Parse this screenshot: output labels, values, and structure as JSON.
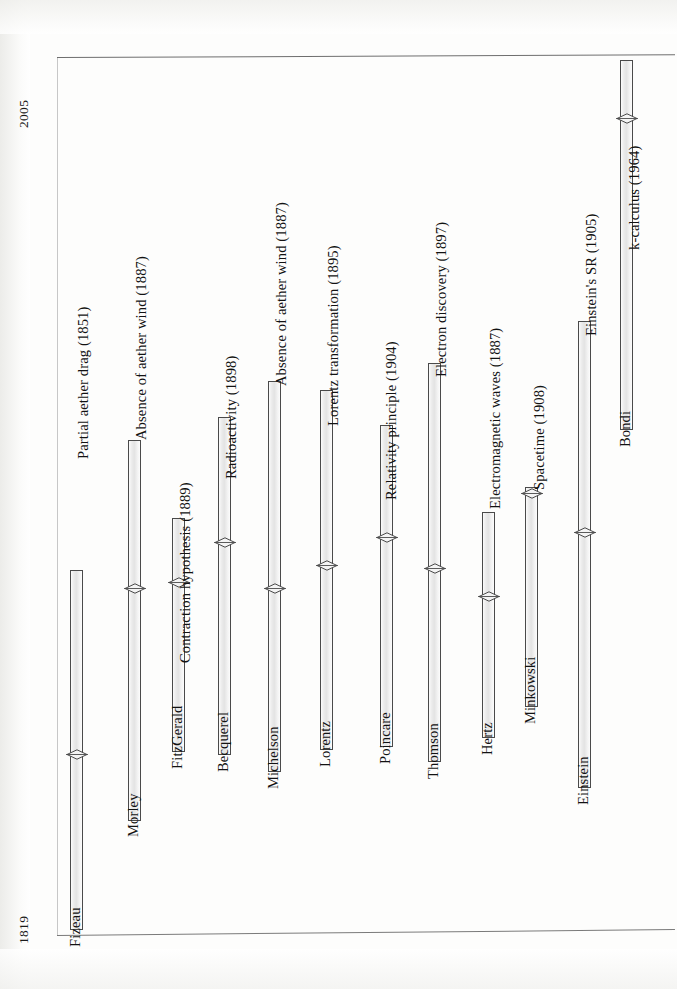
{
  "axis": {
    "top_label": "2005",
    "bottom_label": "1819",
    "year_min": 1819,
    "year_max": 2005
  },
  "chart_data": {
    "type": "bar",
    "title": "",
    "subtitle": "",
    "orientation": "vertical-rotated",
    "xlabel": "",
    "ylabel": "Year",
    "ylim": [
      1819,
      2005
    ],
    "grid": false,
    "legend": "none",
    "categories": [
      "Fizeau",
      "Morley",
      "FitzGerald",
      "Becquerel",
      "Michelson",
      "Lorentz",
      "Poincare",
      "Thomson",
      "Hertz",
      "Minkowski",
      "Einstein",
      "Bondi"
    ],
    "bars": [
      {
        "person": "Fizeau",
        "event": "Partial aether drag (1851)",
        "event_year": 1851,
        "px_left": 70,
        "px_top": 570,
        "px_bottom": 930,
        "marker_px_y": 754
      },
      {
        "person": "Morley",
        "event": "Absence of aether wind (1887)",
        "event_year": 1887,
        "px_left": 128,
        "px_top": 440,
        "px_bottom": 821,
        "marker_px_y": 588
      },
      {
        "person": "FitzGerald",
        "event": "Contraction hypothesis (1889)",
        "event_year": 1889,
        "px_left": 172,
        "px_top": 518,
        "px_bottom": 752,
        "marker_px_y": 582
      },
      {
        "person": "Becquerel",
        "event": "Radioactivity (1898)",
        "event_year": 1898,
        "px_left": 218,
        "px_top": 417,
        "px_bottom": 755,
        "marker_px_y": 542
      },
      {
        "person": "Michelson",
        "event": "Absence of aether wind (1887)",
        "event_year": 1887,
        "px_left": 268,
        "px_top": 381,
        "px_bottom": 772,
        "marker_px_y": 588
      },
      {
        "person": "Lorentz",
        "event": "Lorentz transformation (1895)",
        "event_year": 1895,
        "px_left": 320,
        "px_top": 390,
        "px_bottom": 750,
        "marker_px_y": 565
      },
      {
        "person": "Poincare",
        "event": "Relativity principle (1904)",
        "event_year": 1904,
        "px_left": 380,
        "px_top": 425,
        "px_bottom": 747,
        "marker_px_y": 537
      },
      {
        "person": "Thomson",
        "event": "Electron discovery (1897)",
        "event_year": 1897,
        "px_left": 428,
        "px_top": 363,
        "px_bottom": 762,
        "marker_px_y": 568
      },
      {
        "person": "Hertz",
        "event": "Electromagnetic waves (1887)",
        "event_year": 1887,
        "px_left": 482,
        "px_top": 512,
        "px_bottom": 738,
        "marker_px_y": 596
      },
      {
        "person": "Minkowski",
        "event": "Spacetime (1908)",
        "event_year": 1908,
        "px_left": 525,
        "px_top": 487,
        "px_bottom": 707,
        "marker_px_y": 493
      },
      {
        "person": "Einstein",
        "event": "Einstein's  SR (1905)",
        "event_year": 1905,
        "px_left": 578,
        "px_top": 321,
        "px_bottom": 788,
        "marker_px_y": 532
      },
      {
        "person": "Bondi",
        "event": "k-calculus (1964)",
        "event_year": 1964,
        "px_left": 620,
        "px_top": 60,
        "px_bottom": 430,
        "marker_px_y": 118
      }
    ]
  },
  "labels": {
    "events": [
      "Partial aether drag (1851)",
      "Absence of aether wind (1887)",
      "Contraction hypothesis (1889)",
      "Radioactivity (1898)",
      "Absence of aether wind (1887)",
      "Lorentz transformation (1895)",
      "Relativity principle (1904)",
      "Electron discovery (1897)",
      "Electromagnetic waves (1887)",
      "Spacetime (1908)",
      "Einstein's  SR (1905)",
      "k-calculus (1964)"
    ],
    "persons": [
      "Fizeau",
      "Morley",
      "FitzGerald",
      "Becquerel",
      "Michelson",
      "Lorentz",
      "Poincare",
      "Thomson",
      "Hertz",
      "Minkowski",
      "Einstein",
      "Bondi"
    ]
  },
  "event_label_positions": [
    {
      "left": 92,
      "top": 442
    },
    {
      "left": 150,
      "top": 423
    },
    {
      "left": 194,
      "top": 646
    },
    {
      "left": 240,
      "top": 462
    },
    {
      "left": 290,
      "top": 369
    },
    {
      "left": 342,
      "top": 409
    },
    {
      "left": 400,
      "top": 483
    },
    {
      "left": 450,
      "top": 360
    },
    {
      "left": 504,
      "top": 492
    },
    {
      "left": 548,
      "top": 473
    },
    {
      "left": 600,
      "top": 319
    },
    {
      "left": 643,
      "top": 233
    }
  ],
  "person_label_positions": [
    {
      "left": 84,
      "top": 930
    },
    {
      "left": 142,
      "top": 820
    },
    {
      "left": 186,
      "top": 752
    },
    {
      "left": 232,
      "top": 755
    },
    {
      "left": 282,
      "top": 772
    },
    {
      "left": 334,
      "top": 750
    },
    {
      "left": 394,
      "top": 747
    },
    {
      "left": 442,
      "top": 762
    },
    {
      "left": 496,
      "top": 738
    },
    {
      "left": 539,
      "top": 707
    },
    {
      "left": 592,
      "top": 788
    },
    {
      "left": 634,
      "top": 430
    }
  ],
  "colors": {
    "bar_fill": "#ebebeb",
    "bar_stroke": "#4a4a4a",
    "axis": "#6e6e6e",
    "text": "#121212",
    "page": "#ffffff"
  }
}
